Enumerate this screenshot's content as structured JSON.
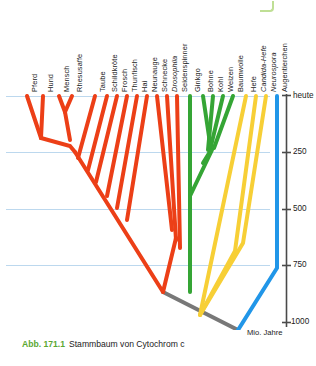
{
  "figure": {
    "caption_number": "Abb. 171.1",
    "caption_text": "Stammbaum von Cytochrom c",
    "caption_number_color": "#5aa832"
  },
  "colors": {
    "animals_red": "#ec3f17",
    "plants_green": "#35a535",
    "fungi_yellow": "#f7cf36",
    "euglena_blue": "#2196e8",
    "root_gray": "#787878",
    "axis_dark": "#4a4a4a",
    "gridline_blue": "#bcd8ee"
  },
  "axis": {
    "present_label": "heute",
    "unit_label": "Mio. Jahre",
    "ticks": [
      {
        "label": "heute",
        "value": 0
      },
      {
        "label": "250",
        "value": 250
      },
      {
        "label": "500",
        "value": 500
      },
      {
        "label": "750",
        "value": 750
      },
      {
        "label": "1000",
        "value": 1000
      }
    ],
    "range": [
      0,
      1000
    ],
    "direction": "present-at-top"
  },
  "chart_data": {
    "type": "diagram",
    "subtype": "phylogenetic-tree",
    "title": "Stammbaum von Cytochrom c",
    "xlabel": "",
    "ylabel": "Mio. Jahre",
    "ylim": [
      0,
      1000
    ],
    "grid": true,
    "legend": "none",
    "groups": [
      {
        "name": "Tiere",
        "color": "#ec3f17"
      },
      {
        "name": "Pflanzen",
        "color": "#35a535"
      },
      {
        "name": "Pilze",
        "color": "#f7cf36"
      },
      {
        "name": "Euglena",
        "color": "#2196e8"
      },
      {
        "name": "Wurzel",
        "color": "#787878"
      }
    ],
    "taxa": [
      {
        "label": "Pferd",
        "group": "Tiere",
        "color": "#ec3f17",
        "x": 27,
        "italic": false
      },
      {
        "label": "Hund",
        "group": "Tiere",
        "color": "#ec3f17",
        "x": 43,
        "italic": false
      },
      {
        "label": "Mensch",
        "group": "Tiere",
        "color": "#ec3f17",
        "x": 59,
        "italic": false
      },
      {
        "label": "Rhesusaffe",
        "group": "Tiere",
        "color": "#ec3f17",
        "x": 72,
        "italic": false
      },
      {
        "label": "Taube",
        "group": "Tiere",
        "color": "#ec3f17",
        "x": 95,
        "italic": false
      },
      {
        "label": "Schildkröte",
        "group": "Tiere",
        "color": "#ec3f17",
        "x": 107,
        "italic": false
      },
      {
        "label": "Frosch",
        "group": "Tiere",
        "color": "#ec3f17",
        "x": 117,
        "italic": false
      },
      {
        "label": "Thunfisch",
        "group": "Tiere",
        "color": "#ec3f17",
        "x": 127,
        "italic": false
      },
      {
        "label": "Hai",
        "group": "Tiere",
        "color": "#ec3f17",
        "x": 137,
        "italic": false
      },
      {
        "label": "Neunauge",
        "group": "Tiere",
        "color": "#ec3f17",
        "x": 147,
        "italic": false
      },
      {
        "label": "Schnecke",
        "group": "Tiere",
        "color": "#ec3f17",
        "x": 157,
        "italic": false
      },
      {
        "label": "Drosophila",
        "group": "Tiere",
        "color": "#ec3f17",
        "x": 167,
        "italic": true
      },
      {
        "label": "Seidenspinner",
        "group": "Tiere",
        "color": "#ec3f17",
        "x": 177,
        "italic": false
      },
      {
        "label": "Ginkgo",
        "group": "Pflanzen",
        "color": "#35a535",
        "x": 190,
        "italic": false
      },
      {
        "label": "Bohne",
        "group": "Pflanzen",
        "color": "#35a535",
        "x": 203,
        "italic": false
      },
      {
        "label": "Kohl",
        "group": "Pflanzen",
        "color": "#35a535",
        "x": 213,
        "italic": false
      },
      {
        "label": "Weizen",
        "group": "Pflanzen",
        "color": "#35a535",
        "x": 223,
        "italic": false
      },
      {
        "label": "Baumwolle",
        "group": "Pflanzen",
        "color": "#35a535",
        "x": 233,
        "italic": false
      },
      {
        "label": "Hefe",
        "group": "Pilze",
        "color": "#f7cf36",
        "x": 246,
        "italic": false
      },
      {
        "label": "Candida-Hefe",
        "group": "Pilze",
        "color": "#f7cf36",
        "x": 256,
        "italic": true
      },
      {
        "label": "Neurospora",
        "group": "Pilze",
        "color": "#f7cf36",
        "x": 266,
        "italic": true
      },
      {
        "label": "Augentierchen",
        "group": "Euglena",
        "color": "#2196e8",
        "x": 277,
        "italic": false
      }
    ],
    "nodes": [
      {
        "name": "Pferd-Hund",
        "depth_mya": 80,
        "group": "Tiere"
      },
      {
        "name": "Mensch-Rhesusaffe",
        "depth_mya": 45,
        "group": "Tiere"
      },
      {
        "name": "Primaten-Carnivora",
        "depth_mya": 170,
        "group": "Tiere"
      },
      {
        "name": "Saeuger-Voegel",
        "depth_mya": 280,
        "group": "Tiere"
      },
      {
        "name": "Amnioten-Amphibien",
        "depth_mya": 330,
        "group": "Tiere"
      },
      {
        "name": "Tetrapoda-Fische",
        "depth_mya": 400,
        "group": "Tiere"
      },
      {
        "name": "Wirbeltiere",
        "depth_mya": 470,
        "group": "Tiere"
      },
      {
        "name": "Mollusken-Insekten",
        "depth_mya": 480,
        "group": "Tiere"
      },
      {
        "name": "Protostomia-Deuterost",
        "depth_mya": 700,
        "group": "Tiere"
      },
      {
        "name": "Samenpflanzen",
        "depth_mya": 290,
        "group": "Pflanzen"
      },
      {
        "name": "Pflanzen-Wurzel",
        "depth_mya": 740,
        "group": "Pflanzen"
      },
      {
        "name": "Pilze-Wurzel",
        "depth_mya": 860,
        "group": "Pilze"
      },
      {
        "name": "Eukaryoten-Wurzel",
        "depth_mya": 980,
        "group": "Wurzel"
      }
    ]
  }
}
